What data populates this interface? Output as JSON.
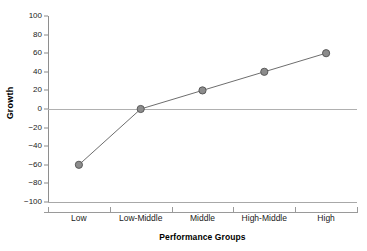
{
  "chart_data": {
    "type": "line",
    "title": "",
    "xlabel": "Performance Groups",
    "ylabel": "Growth",
    "categories": [
      "Low",
      "Low-Middle",
      "Middle",
      "High-Middle",
      "High"
    ],
    "values": [
      -60,
      0,
      20,
      40,
      60
    ],
    "series": [
      {
        "name": "Growth",
        "values": [
          -60,
          0,
          20,
          40,
          60
        ]
      }
    ],
    "ylim": [
      -100,
      100
    ],
    "ytick_values": [
      100,
      80,
      60,
      40,
      20,
      0,
      -20,
      -40,
      -60,
      -80,
      -100
    ],
    "ytick_labels": [
      "100",
      "80",
      "60",
      "40",
      "20",
      "0",
      "−20",
      "−40",
      "−60",
      "−80",
      "−100"
    ],
    "grid": false,
    "legend": "none",
    "zero_reference_line": 0,
    "marker": "circle",
    "marker_fill_color": "#8c8c8c",
    "marker_edge_color": "#5a5a5a",
    "line_color": "#6e6e6e",
    "axis_color": "#9a9a9a",
    "background_color": "#ffffff",
    "text_color": "#1a1a1a"
  }
}
